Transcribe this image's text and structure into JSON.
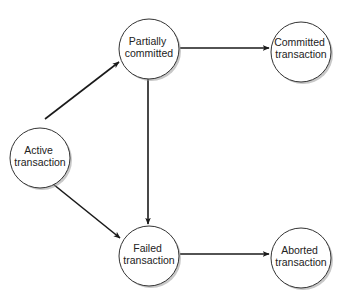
{
  "diagram": {
    "type": "state-transition",
    "nodes": [
      {
        "id": "active",
        "line1": "Active",
        "line2": "transaction",
        "cx": 40,
        "cy": 158,
        "r": 30
      },
      {
        "id": "partially_committed",
        "line1": "Partially",
        "line2": "committed",
        "cx": 149,
        "cy": 49,
        "r": 30
      },
      {
        "id": "committed",
        "line1": "Committed",
        "line2": "transaction",
        "cx": 301,
        "cy": 52,
        "r": 30
      },
      {
        "id": "failed",
        "line1": "Failed",
        "line2": "transaction",
        "cx": 149,
        "cy": 256,
        "r": 30
      },
      {
        "id": "aborted",
        "line1": "Aborted",
        "line2": "transaction",
        "cx": 301,
        "cy": 258,
        "r": 30
      }
    ],
    "edges": [
      {
        "from": "active",
        "to": "partially_committed"
      },
      {
        "from": "active",
        "to": "failed"
      },
      {
        "from": "partially_committed",
        "to": "committed"
      },
      {
        "from": "partially_committed",
        "to": "failed"
      },
      {
        "from": "failed",
        "to": "aborted"
      }
    ],
    "colors": {
      "stroke": "#1a1a1a",
      "node_fill": "#ffffff",
      "text": "#222222",
      "shadow": "#9a9a9a"
    }
  }
}
